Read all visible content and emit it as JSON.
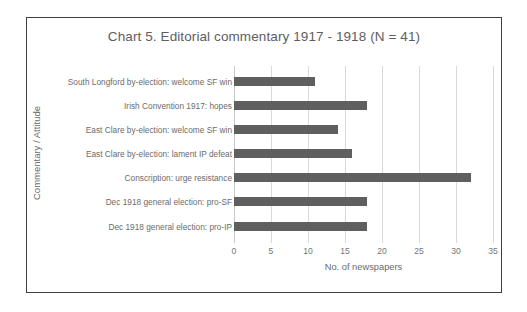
{
  "chart_data": {
    "type": "bar",
    "orientation": "horizontal",
    "title": "Chart 5. Editorial commentary 1917 - 1918 (N = 41)",
    "xlabel": "No. of newspapers",
    "ylabel": "Commentary / Attitude",
    "categories": [
      "South Longford by-election: welcome SF win",
      "Irish Convention 1917: hopes",
      "East Clare by-election: welcome SF win",
      "East Clare by-election: lament IP defeat",
      "Conscription: urge resistance",
      "Dec 1918 general election: pro-SF",
      "Dec 1918 general election: pro-IP"
    ],
    "values": [
      11,
      18,
      14,
      16,
      32,
      18,
      18
    ],
    "xlim": [
      0,
      35
    ],
    "xticks": [
      "0",
      "5",
      "10",
      "15",
      "20",
      "25",
      "30",
      "35"
    ],
    "xtick_values": [
      0,
      5,
      10,
      15,
      20,
      25,
      30,
      35
    ],
    "grid": "vertical",
    "legend": "none",
    "bar_color": "#5f5f5f",
    "gridline_color": "#d9d9d9",
    "text_color": "#6b6b6b",
    "border_color": "#3f3f3f"
  }
}
